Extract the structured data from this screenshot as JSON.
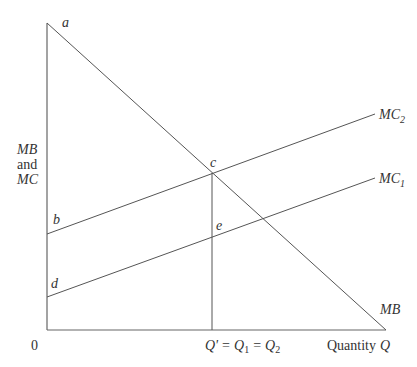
{
  "diagram": {
    "type": "economics-marginal-benefit-cost",
    "y_axis_label": [
      "MB",
      "and",
      "MC"
    ],
    "x_axis_label": "Quantity",
    "x_axis_var": "Q",
    "origin_label": "0",
    "x_marker_label": {
      "q_prime": "Q'",
      "eq1": "=",
      "q1": "Q",
      "q1_sub": "1",
      "eq2": "=",
      "q2": "Q",
      "q2_sub": "2"
    },
    "curves": [
      {
        "name": "MB",
        "label": "MB",
        "from": "a",
        "slope": "negative"
      },
      {
        "name": "MC2",
        "label": "MC",
        "sub": "2",
        "from": "b",
        "slope": "positive"
      },
      {
        "name": "MC1",
        "label": "MC",
        "sub": "1",
        "from": "d",
        "slope": "positive"
      }
    ],
    "points": {
      "a": "a",
      "b": "b",
      "c": "c",
      "d": "d",
      "e": "e"
    },
    "colors": {
      "line": "#555555",
      "text": "#333333"
    }
  }
}
